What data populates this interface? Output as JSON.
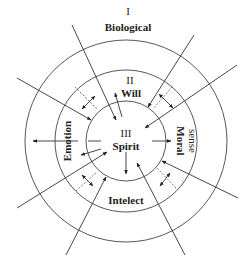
{
  "diagram": {
    "title_numeral": "I",
    "title_label": "Biological",
    "layers": [
      {
        "numeral": "I",
        "label": "Biological",
        "level": "outer"
      },
      {
        "numeral": "II",
        "label": "Will",
        "level": "middle"
      },
      {
        "numeral": "III",
        "label": "Spirit",
        "level": "inner"
      }
    ],
    "middle_ring_labels": {
      "top_numeral": "II",
      "top": "Will",
      "left": "Emotion",
      "right_line1": "Moral",
      "right_line2": "sense",
      "bottom": "Intelect"
    },
    "center": {
      "numeral": "III",
      "label": "Spirit"
    },
    "colors": {
      "line": "#333333",
      "background": "#ffffff",
      "text": "#222222"
    }
  }
}
